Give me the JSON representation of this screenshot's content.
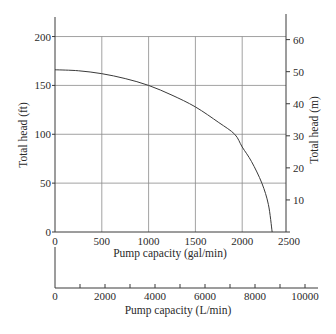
{
  "chart_data": {
    "type": "line",
    "title": "",
    "xlabel": "Pump capacity (gal/min)",
    "ylabel": "Total head (ft)",
    "y2label": "Total head (m)",
    "x2label": "Pump capacity (L/min)",
    "xlim": [
      0,
      2500
    ],
    "ylim": [
      0,
      220
    ],
    "y2lim_m": [
      0,
      67.06
    ],
    "x2lim_lpm": [
      0,
      10500
    ],
    "grid": true,
    "x_ticks": [
      0,
      500,
      1000,
      1500,
      2000,
      2500
    ],
    "y_ticks": [
      0,
      50,
      100,
      150,
      200
    ],
    "y2_ticks": [
      10,
      20,
      30,
      40,
      50,
      60
    ],
    "x2_ticks": [
      0,
      1000,
      2000,
      3000,
      4000,
      5000,
      6000,
      7000,
      8000,
      9000,
      10000
    ],
    "x2_tick_labels": [
      {
        "value": 0,
        "label": "0"
      },
      {
        "value": 2000,
        "label": "2000"
      },
      {
        "value": 4000,
        "label": "4000"
      },
      {
        "value": 6000,
        "label": "6000"
      },
      {
        "value": 8000,
        "label": "8000"
      },
      {
        "value": 10000,
        "label": "10000"
      }
    ],
    "series": [
      {
        "name": "Pump curve",
        "x": [
          0,
          250,
          500,
          750,
          1000,
          1250,
          1500,
          1750,
          1920,
          2000,
          2100,
          2210,
          2280,
          2320
        ],
        "y": [
          166,
          165,
          162,
          157,
          150,
          140,
          128,
          112,
          100,
          87,
          72,
          50,
          28,
          0
        ]
      }
    ]
  }
}
